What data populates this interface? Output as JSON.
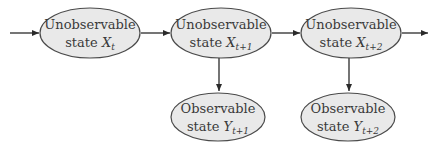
{
  "diagram": {
    "colors": {
      "node_fill": "#e9e9e9",
      "node_stroke": "#4a4a4a",
      "edge": "#2a2a2a",
      "text": "#3a3a3a"
    },
    "nodes": [
      {
        "id": "x_t",
        "line1": "Unobservable",
        "line2_prefix": "state ",
        "var": "X",
        "sub": "t"
      },
      {
        "id": "x_t1",
        "line1": "Unobservable",
        "line2_prefix": "state ",
        "var": "X",
        "sub": "t+1"
      },
      {
        "id": "x_t2",
        "line1": "Unobservable",
        "line2_prefix": "state ",
        "var": "X",
        "sub": "t+2"
      },
      {
        "id": "y_t1",
        "line1": "Observable",
        "line2_prefix": "state ",
        "var": "Y",
        "sub": "t+1"
      },
      {
        "id": "y_t2",
        "line1": "Observable",
        "line2_prefix": "state ",
        "var": "Y",
        "sub": "t+2"
      }
    ],
    "edges": [
      {
        "from": "input",
        "to": "x_t"
      },
      {
        "from": "x_t",
        "to": "x_t1"
      },
      {
        "from": "x_t1",
        "to": "x_t2"
      },
      {
        "from": "x_t2",
        "to": "output"
      },
      {
        "from": "x_t1",
        "to": "y_t1"
      },
      {
        "from": "x_t2",
        "to": "y_t2"
      }
    ]
  }
}
